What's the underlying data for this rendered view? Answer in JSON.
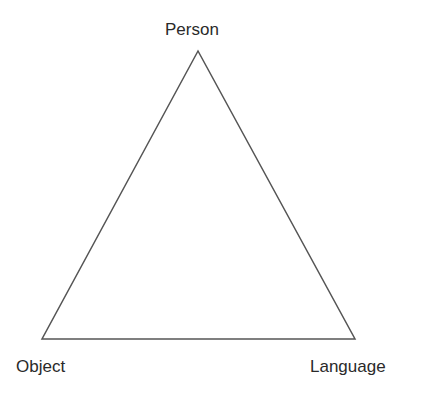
{
  "diagram": {
    "type": "triangle",
    "stroke_color": "#555555",
    "vertices": {
      "top": {
        "label": "Person",
        "x": 198,
        "y": 51
      },
      "bottom_left": {
        "label": "Object",
        "x": 42,
        "y": 339
      },
      "bottom_right": {
        "label": "Language",
        "x": 355,
        "y": 339
      }
    }
  }
}
